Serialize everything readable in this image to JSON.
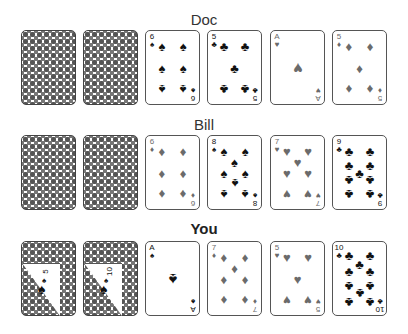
{
  "colors": {
    "red_suit": "#6b6b6b",
    "black_suit": "#111111",
    "card_border": "#555555",
    "background": "#ffffff"
  },
  "players": [
    {
      "name": "Doc",
      "hidden_cards": [
        {
          "state": "face-down"
        },
        {
          "state": "face-down"
        }
      ],
      "up_cards": [
        {
          "rank": "6",
          "suit": "spades",
          "suit_glyph": "♠"
        },
        {
          "rank": "5",
          "suit": "clubs",
          "suit_glyph": "♣"
        },
        {
          "rank": "A",
          "suit": "hearts",
          "suit_glyph": "♥"
        },
        {
          "rank": "5",
          "suit": "diamonds",
          "suit_glyph": "♦"
        }
      ]
    },
    {
      "name": "Bill",
      "hidden_cards": [
        {
          "state": "face-down"
        },
        {
          "state": "face-down"
        }
      ],
      "up_cards": [
        {
          "rank": "6",
          "suit": "diamonds",
          "suit_glyph": "♦"
        },
        {
          "rank": "8",
          "suit": "spades",
          "suit_glyph": "♠"
        },
        {
          "rank": "7",
          "suit": "hearts",
          "suit_glyph": "♥"
        },
        {
          "rank": "9",
          "suit": "clubs",
          "suit_glyph": "♣"
        }
      ]
    },
    {
      "name": "You",
      "hidden_cards": [
        {
          "state": "peeked",
          "rank": "5",
          "suit": "spades",
          "suit_glyph": "♠"
        },
        {
          "state": "peeked",
          "rank": "10",
          "suit": "spades",
          "suit_glyph": "♠"
        }
      ],
      "up_cards": [
        {
          "rank": "A",
          "suit": "spades",
          "suit_glyph": "♠"
        },
        {
          "rank": "7",
          "suit": "diamonds",
          "suit_glyph": "♦"
        },
        {
          "rank": "5",
          "suit": "hearts",
          "suit_glyph": "♥"
        },
        {
          "rank": "10",
          "suit": "clubs",
          "suit_glyph": "♣"
        }
      ]
    }
  ]
}
